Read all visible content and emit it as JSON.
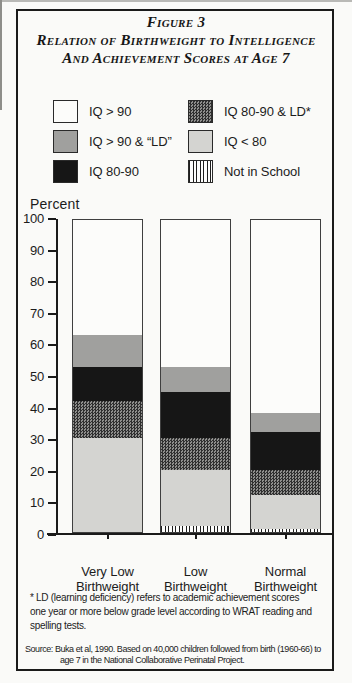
{
  "figure": {
    "title_line1": "Figure 3",
    "title_line2": "Relation of Birthweight to Intelligence",
    "title_line3": "And Achievement Scores at Age 7"
  },
  "legend": {
    "items": [
      {
        "label": "IQ > 90",
        "pattern": "white",
        "color": "#fcfcfa"
      },
      {
        "label": "IQ > 90 & “LD”",
        "pattern": "gray",
        "color": "#a0a09e"
      },
      {
        "label": "IQ 80-90",
        "pattern": "black",
        "color": "#161616"
      },
      {
        "label": "IQ 80-90 & LD*",
        "pattern": "crosshatch",
        "color": "#2f2f2f on #8f8f8d checker"
      },
      {
        "label": "IQ < 80",
        "pattern": "lightgray",
        "color": "#d4d4d1"
      },
      {
        "label": "Not in School",
        "pattern": "vstripes",
        "color": "#1e1e1e stripes on #fdfdfc"
      }
    ]
  },
  "chart_data": {
    "type": "bar",
    "stacked": true,
    "title": "Relation of Birthweight to Intelligence and Achievement Scores at Age 7",
    "ylabel": "Percent",
    "xlabel": "",
    "ylim": [
      0,
      100
    ],
    "yticks": [
      100,
      90,
      80,
      70,
      60,
      50,
      40,
      30,
      20,
      10,
      0
    ],
    "grid": false,
    "legend_position": "top",
    "categories": [
      "Very Low\nBirthweight",
      "Low\nBirthweight",
      "Normal\nBirthweight"
    ],
    "series": [
      {
        "name": "IQ > 90",
        "pattern": "white",
        "values": [
          37,
          47,
          62
        ]
      },
      {
        "name": "IQ > 90 & “LD”",
        "pattern": "gray",
        "values": [
          10,
          8,
          6
        ]
      },
      {
        "name": "IQ 80-90",
        "pattern": "black",
        "values": [
          11,
          15,
          12
        ]
      },
      {
        "name": "IQ 80-90 & LD*",
        "pattern": "crosshatch",
        "values": [
          12,
          10,
          8
        ]
      },
      {
        "name": "IQ < 80",
        "pattern": "lightgray",
        "values": [
          30,
          18,
          11
        ]
      },
      {
        "name": "Not in School",
        "pattern": "vstripes",
        "values": [
          0,
          2,
          1
        ]
      }
    ]
  },
  "footnote": "* LD (learning deficiency) refers to academic achievement scores\none year or more below grade level according to WRAT reading and\nspelling tests.",
  "source": {
    "line1": "Source: Buka et al, 1990. Based on 40,000 children followed from birth (1960-66) to",
    "line2": "age 7 in the National Collaborative Perinatal Project."
  }
}
